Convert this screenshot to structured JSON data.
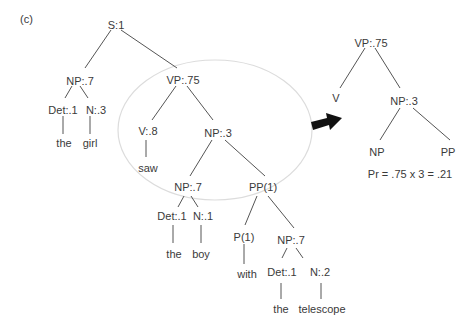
{
  "panel_label": "(c)",
  "main_tree": {
    "S": "S:1",
    "NP_subj": "NP:.7",
    "Det1": "Det:.1",
    "N1": "N:.3",
    "w_the1": "the",
    "w_girl": "girl",
    "VP": "VP:.75",
    "V": "V:.8",
    "w_saw": "saw",
    "NP_obj": "NP:.3",
    "NP_inner": "NP:.7",
    "Det2": "Det:.1",
    "N2": "N:.1",
    "w_the2": "the",
    "w_boy": "boy",
    "PP": "PP(1)",
    "P": "P(1)",
    "w_with": "with",
    "NP_pp": "NP:.7",
    "Det3": "Det:.1",
    "N3": "N:.2",
    "w_the3": "the",
    "w_telescope": "telescope"
  },
  "rule_tree": {
    "VP": "VP:.75",
    "V": "V",
    "NP": "NP:.3",
    "NP_child": "NP",
    "PP_child": "PP"
  },
  "probability": "Pr = .75 x 3 = .21",
  "colors": {
    "ellipse": "#dcdcdc",
    "lines": "#555555",
    "arrow": "#111111"
  }
}
